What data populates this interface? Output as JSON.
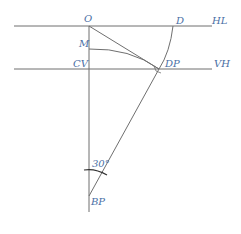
{
  "diagram": {
    "type": "perspective-construction",
    "colors": {
      "line": "#6f6f6f",
      "label": "#4a6fa5",
      "background": "#ffffff"
    },
    "labels": {
      "O": "O",
      "D": "D",
      "HL": "HL",
      "M": "M",
      "CV": "CV",
      "DP": "DP",
      "VH": "VH",
      "BP": "BP",
      "angle": "30°"
    },
    "points": {
      "O": [
        89,
        26
      ],
      "D": [
        173,
        26
      ],
      "M": [
        89,
        49
      ],
      "CV": [
        89,
        69
      ],
      "DP": [
        159,
        69
      ],
      "BP": [
        89,
        196
      ]
    },
    "lines": {
      "HL": {
        "y": 26,
        "x1": 14,
        "x2": 212
      },
      "VH": {
        "y": 69,
        "x1": 14,
        "x2": 212
      },
      "vertical": {
        "x": 89,
        "y1": 26,
        "y2": 212
      }
    }
  }
}
